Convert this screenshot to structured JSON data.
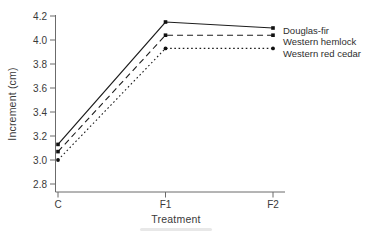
{
  "chart_data": {
    "type": "line",
    "categories": [
      "C",
      "F1",
      "F2"
    ],
    "series": [
      {
        "name": "Douglas-fir",
        "values": [
          3.13,
          4.15,
          4.1
        ],
        "line_style": "solid",
        "marker": "square"
      },
      {
        "name": "Western hemlock",
        "values": [
          3.07,
          4.04,
          4.04
        ],
        "line_style": "dashed",
        "marker": "square"
      },
      {
        "name": "Western red cedar",
        "values": [
          3.0,
          3.93,
          3.93
        ],
        "line_style": "dotted",
        "marker": "circle"
      }
    ],
    "title": "",
    "xlabel": "Treatment",
    "ylabel": "Increment (cm)",
    "ylim": [
      2.8,
      4.2
    ],
    "ytick_step": 0.2,
    "yticks": [
      2.8,
      3.0,
      3.2,
      3.4,
      3.6,
      3.8,
      4.0,
      4.2
    ],
    "grid": false,
    "legend_position": "right-of-line-ends",
    "line_color": "#1c1c1c",
    "axis_color": "#6b6b6b",
    "text_color": "#3a3a3a"
  }
}
